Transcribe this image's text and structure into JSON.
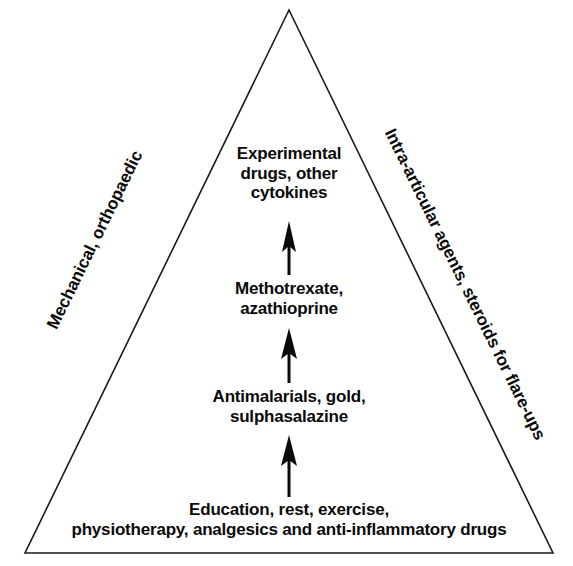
{
  "diagram": {
    "type": "therapeutic-pyramid",
    "shape": "triangle",
    "outline_color": "#1a1a1a",
    "text_color": "#0a0a0a",
    "background_color": "#ffffff",
    "apex": {
      "x": 289,
      "y": 10
    },
    "bottom_left": {
      "x": 25,
      "y": 553
    },
    "bottom_right": {
      "x": 553,
      "y": 553
    },
    "tiers": [
      {
        "level": 1,
        "position": "bottom",
        "label": "Education, rest, exercise,\nphysiotherapy, analgesics and anti-inflammatory drugs"
      },
      {
        "level": 2,
        "position": "lower-middle",
        "label": "Antimalarials, gold,\nsulphasalazine"
      },
      {
        "level": 3,
        "position": "upper-middle",
        "label": "Methotrexate,\nazathioprine"
      },
      {
        "level": 4,
        "position": "top",
        "label": "Experimental\ndrugs, other\ncytokines"
      }
    ],
    "arrows": [
      {
        "name": "arrow-tier1-to-tier2",
        "direction": "up",
        "x": 289,
        "y_top": 437,
        "y_bottom": 497
      },
      {
        "name": "arrow-tier2-to-tier3",
        "direction": "up",
        "x": 289,
        "y_top": 329,
        "y_bottom": 383
      },
      {
        "name": "arrow-tier3-to-tier4",
        "direction": "up",
        "x": 289,
        "y_top": 222,
        "y_bottom": 275
      }
    ],
    "side_labels": {
      "left": "Mechanical, orthopaedic",
      "right": "Intra-articular agents, steroids for flare-ups"
    }
  }
}
